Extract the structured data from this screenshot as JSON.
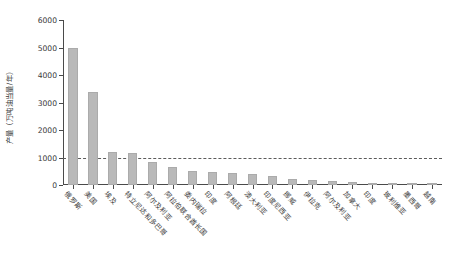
{
  "chart_data": {
    "type": "bar",
    "title": "",
    "xlabel": "",
    "ylabel": "产量（万吨油当量/年）",
    "ylim": [
      0,
      6000
    ],
    "ytick_labels": [
      "0",
      "1000",
      "2000",
      "3000",
      "4000",
      "5000",
      "6000"
    ],
    "ytick_values": [
      0,
      1000,
      2000,
      3000,
      4000,
      5000,
      6000
    ],
    "grid": false,
    "legend": null,
    "bar_color": "#b9b9b9",
    "reference_line": {
      "value": 1000,
      "style": "dashed",
      "color": "#5b5b5b"
    },
    "categories": [
      "俄罗斯",
      "美国",
      "埃及",
      "特立尼达和多巴哥",
      "阿尔及利亚",
      "阿拉伯联合酋长国",
      "委内瑞拉",
      "印度",
      "阿根廷",
      "澳大利亚",
      "印度尼西亚",
      "挪威",
      "伊拉克",
      "阿尔及利亚",
      "加拿大",
      "印度",
      "玻利维亚",
      "墨西哥",
      "越南"
    ],
    "values": [
      5000,
      3400,
      1200,
      1150,
      820,
      640,
      520,
      480,
      420,
      400,
      330,
      230,
      190,
      150,
      100,
      70,
      50,
      40,
      30
    ]
  }
}
